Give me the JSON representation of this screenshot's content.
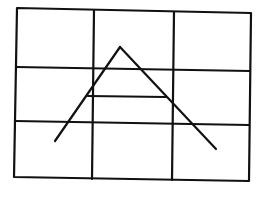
{
  "diagram": {
    "stroke_color": "#111111",
    "background": "#ffffff",
    "grid": {
      "outer": [
        [
          17,
          8
        ],
        [
          251,
          13
        ],
        [
          249,
          181
        ],
        [
          14,
          177
        ]
      ],
      "vertical_lines": [
        [
          [
            94,
            10
          ],
          [
            92,
            179
          ]
        ],
        [
          [
            174,
            12
          ],
          [
            172,
            180
          ]
        ]
      ],
      "horizontal_lines": [
        [
          [
            16,
            67
          ],
          [
            250,
            71
          ]
        ],
        [
          [
            15,
            121
          ],
          [
            249,
            125
          ]
        ]
      ]
    },
    "figure": {
      "left_stroke": [
        [
          55,
          141
        ],
        [
          120,
          47
        ]
      ],
      "right_stroke": [
        [
          120,
          47
        ],
        [
          216,
          149
        ]
      ],
      "crossbar": [
        [
          88,
          96
        ],
        [
          166,
          97
        ]
      ]
    }
  }
}
